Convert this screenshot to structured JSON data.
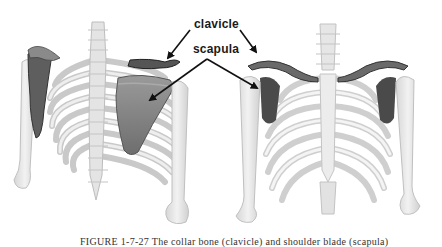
{
  "figure": {
    "labels": {
      "clavicle": "clavicle",
      "scapula": "scapula"
    },
    "caption": "FIGURE 1-7-27  The collar bone (clavicle) and shoulder blade (scapula)",
    "panels": [
      {
        "view": "posterior",
        "description": "Back view of upper skeleton showing scapula and clavicle highlighted"
      },
      {
        "view": "anterior",
        "description": "Front view of rib cage showing clavicles and scapulae highlighted"
      }
    ],
    "colors": {
      "bone": "#e8e8e8",
      "bone_shade": "#cfcfcf",
      "highlight": "#7a7a7a",
      "highlight_dark": "#3c3c3c",
      "arrow": "#111111"
    }
  }
}
